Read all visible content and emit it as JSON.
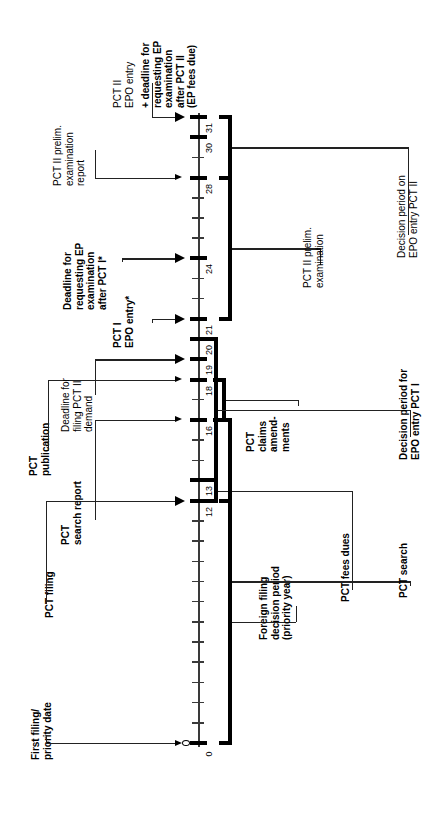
{
  "diagram": {
    "orientation": "rotated-90",
    "axis": {
      "unit": "months from first filing / priority date",
      "min": 0,
      "max": 31,
      "labeled_ticks": [
        "0",
        "12",
        "13",
        "16",
        "18",
        "19",
        "20",
        "21",
        "24",
        "28",
        "30",
        "31"
      ],
      "minor_tick_interval": 1
    },
    "events": [
      {
        "id": "first-filing",
        "month": 0,
        "label_lines": [
          "First filing/",
          "priority date"
        ],
        "bold": true,
        "arrow": "small"
      },
      {
        "id": "pct-filing",
        "month": 12,
        "label_lines": [
          "PCT filing"
        ],
        "bold": true,
        "arrow": "large"
      },
      {
        "id": "pct-search-report",
        "month": 16,
        "label_lines": [
          "PCT",
          "search report"
        ],
        "bold": true,
        "arrow": "small"
      },
      {
        "id": "pct-publication",
        "month": 18,
        "label_lines": [
          "PCT",
          "publication"
        ],
        "bold": true,
        "arrow": "small"
      },
      {
        "id": "pct-ii-demand",
        "month": 19,
        "label_lines": [
          "Deadline for",
          "filing PCT II",
          "demand"
        ],
        "bold": false,
        "arrow": "large"
      },
      {
        "id": "pct-i-epo-entry",
        "month": 21,
        "label_lines": [
          "PCT I",
          "EPO entry*"
        ],
        "bold": true,
        "arrow": "large"
      },
      {
        "id": "ep-exam-deadline-i",
        "month": 24,
        "label_lines": [
          "Deadline for",
          "requesting EP",
          "examination",
          "after PCT I*"
        ],
        "bold": true,
        "arrow": "large"
      },
      {
        "id": "pct-ii-exam-report",
        "month": 28,
        "label_lines": [
          "PCT II prelim.",
          "examination",
          "report"
        ],
        "bold": false,
        "arrow": "small"
      },
      {
        "id": "pct-ii-epo-entry",
        "month": 31,
        "label_lines": [
          "PCT II",
          "EPO entry"
        ],
        "bold": false,
        "arrow": "large"
      },
      {
        "id": "ep-exam-deadline-ii",
        "month": 31,
        "label_lines": [
          "+ deadline for",
          "requesting EP",
          "examination",
          "after PCT II",
          "(EP fees due)"
        ],
        "bold": true,
        "arrow": "none"
      }
    ],
    "periods": [
      {
        "id": "foreign-filing-decision",
        "from": 0,
        "to": 12,
        "label_lines": [
          "Foreign filing",
          "decision period",
          "(priority year)"
        ],
        "bold": true
      },
      {
        "id": "pct-fees-dues",
        "from": 12,
        "to": 13,
        "label_lines": [
          "PCT fees dues"
        ],
        "bold": true
      },
      {
        "id": "pct-search",
        "from": 0,
        "to": 16,
        "label_lines": [
          "PCT search"
        ],
        "bold": true
      },
      {
        "id": "pct-claims-amendments",
        "from": 16,
        "to": 18,
        "label_lines": [
          "PCT",
          "claims",
          "amend-",
          "ments"
        ],
        "bold": true
      },
      {
        "id": "decision-period-epo-i",
        "from": 13,
        "to": 20,
        "label_lines": [
          "Decision period for",
          "EPO entry PCT I"
        ],
        "bold": true
      },
      {
        "id": "pct-ii-prelim-exam",
        "from": 21,
        "to": 28,
        "label_lines": [
          "PCT II prelim.",
          "examination"
        ],
        "bold": false
      },
      {
        "id": "decision-period-epo-ii",
        "from": 28,
        "to": 31,
        "label_lines": [
          "Decision period on",
          "EPO entry PCT II"
        ],
        "bold": false
      }
    ]
  }
}
